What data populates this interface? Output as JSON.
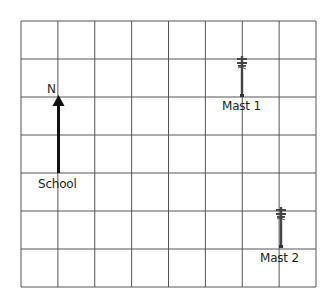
{
  "diagram": {
    "type": "grid-map",
    "grid": {
      "columns": 8,
      "rows": 7,
      "line_color": "#555555",
      "background": "#ffffff"
    },
    "compass": {
      "label": "N",
      "direction": "up"
    },
    "places": [
      {
        "name": "School",
        "col": 1,
        "row": 4,
        "marker": "arrow-base"
      },
      {
        "name": "Mast 1",
        "col": 6,
        "row": 2,
        "marker": "mast-icon"
      },
      {
        "name": "Mast 2",
        "col": 7,
        "row": 6,
        "marker": "mast-icon"
      }
    ]
  },
  "labels": {
    "north": "N",
    "school": "School",
    "mast1": "Mast 1",
    "mast2": "Mast 2"
  }
}
